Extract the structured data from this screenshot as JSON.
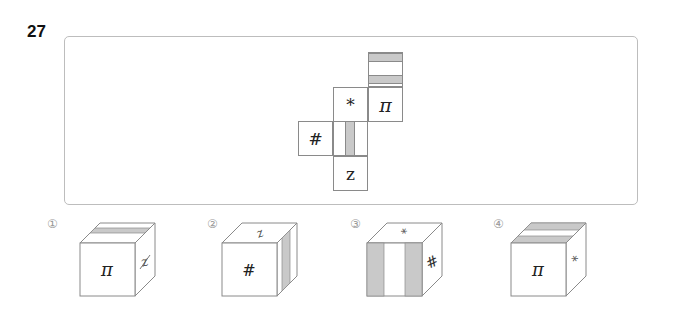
{
  "question": {
    "number": "27",
    "net": {
      "cells": [
        {
          "id": "top-stripes",
          "symbol": "",
          "pattern": "two-horizontal-gray-stripes"
        },
        {
          "id": "asterisk",
          "symbol": "*"
        },
        {
          "id": "pi",
          "symbol": "π"
        },
        {
          "id": "hash",
          "symbol": "#"
        },
        {
          "id": "center-stripe",
          "symbol": "",
          "pattern": "vertical-gray-stripe"
        },
        {
          "id": "z",
          "symbol": "z"
        }
      ]
    },
    "options": [
      {
        "label": "①",
        "front": "π",
        "top": "one-horizontal-stripe",
        "right": "z (rotated)"
      },
      {
        "label": "②",
        "front": "#",
        "top": "z (rotated)",
        "right": "vertical-stripe"
      },
      {
        "label": "③",
        "front": "two-vertical-stripes",
        "top": "* (rotated)",
        "right": "# (rotated)"
      },
      {
        "label": "④",
        "front": "π",
        "top": "two-horizontal-stripes",
        "right": "* (rotated)"
      }
    ]
  },
  "colors": {
    "stripe": "#c9c9c9",
    "line": "#8a8a8a",
    "frame": "#bdbdbd"
  }
}
